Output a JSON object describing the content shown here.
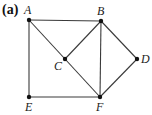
{
  "figure": {
    "panel_label": "(a)",
    "nodes": [
      {
        "id": "A",
        "label": "A",
        "x": 29,
        "y": 20,
        "lx": 24,
        "ly": 14
      },
      {
        "id": "B",
        "label": "B",
        "x": 101,
        "y": 21,
        "lx": 97,
        "ly": 15
      },
      {
        "id": "C",
        "label": "C",
        "x": 65,
        "y": 59,
        "lx": 54,
        "ly": 70
      },
      {
        "id": "D",
        "label": "D",
        "x": 137,
        "y": 59,
        "lx": 141,
        "ly": 63
      },
      {
        "id": "E",
        "label": "E",
        "x": 29,
        "y": 97,
        "lx": 25,
        "ly": 111
      },
      {
        "id": "F",
        "label": "F",
        "x": 100,
        "y": 97,
        "lx": 96,
        "ly": 111
      }
    ],
    "edges": [
      [
        "A",
        "B"
      ],
      [
        "A",
        "E"
      ],
      [
        "A",
        "C"
      ],
      [
        "C",
        "F"
      ],
      [
        "B",
        "C"
      ],
      [
        "B",
        "F"
      ],
      [
        "B",
        "D"
      ],
      [
        "D",
        "F"
      ],
      [
        "E",
        "F"
      ]
    ],
    "colors": {
      "edge": "#3a3a3a",
      "node": "#111111",
      "label": "#222222"
    }
  }
}
